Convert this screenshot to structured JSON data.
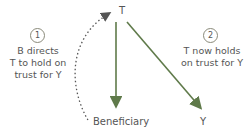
{
  "nodes": {
    "trustee": "T",
    "beneficiary": "Beneficiary",
    "third_party": "Y"
  },
  "steps": [
    {
      "number": "1",
      "text_lines": [
        "B directs",
        "T to hold on",
        "trust for Y"
      ]
    },
    {
      "number": "2",
      "text_lines": [
        "T now holds",
        "on trust for Y"
      ]
    }
  ],
  "colors": {
    "arrow": "#5f7a4a",
    "dotted_arrow": "#666666",
    "text": "#555555"
  }
}
